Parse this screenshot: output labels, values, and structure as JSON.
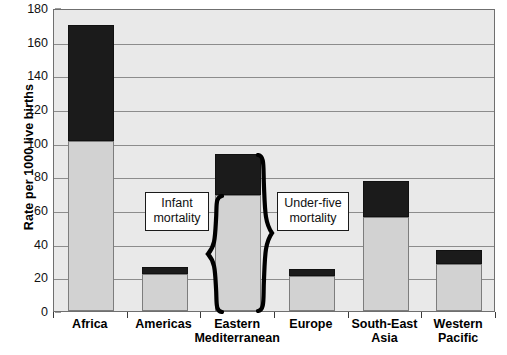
{
  "chart_data": {
    "type": "bar",
    "subtype": "stacked-bar",
    "title": "",
    "xlabel": "",
    "ylabel": "Rate per 1000 live births",
    "ylim": [
      0,
      180
    ],
    "yticks": [
      0,
      20,
      40,
      60,
      80,
      100,
      120,
      140,
      160,
      180
    ],
    "ytick_labels": [
      "0",
      "20",
      "40",
      "60",
      "80",
      "100",
      "120",
      "140",
      "160",
      "180"
    ],
    "grid": true,
    "legend_position": "none",
    "categories": [
      "Africa",
      "Americas",
      "Eastern\nMediterranean",
      "Europe",
      "South-East\nAsia",
      "Western\nPacific"
    ],
    "series": [
      {
        "name": "Infant mortality",
        "color": "#d2d2d2",
        "values": [
          101,
          22,
          69,
          21,
          56,
          28
        ]
      },
      {
        "name": "Under-five mortality (additional above infant)",
        "color": "#1b1b1b",
        "values": [
          69,
          4,
          24,
          4,
          21,
          8
        ]
      }
    ],
    "totals": {
      "label": "Under-five mortality (total bar height)",
      "values": [
        170,
        26,
        93,
        25,
        77,
        36
      ]
    },
    "annotations": [
      {
        "name": "infant-mortality-callout",
        "text": "Infant\nmortality"
      },
      {
        "name": "under-five-mortality-callout",
        "text": "Under-five\nmortality"
      }
    ],
    "colors": {
      "plot_background": "#e9e9e9",
      "gridline": "#8c8c8c",
      "axis": "#6f6f6f",
      "infant_bar": "#d2d2d2",
      "under_five_bar": "#1b1b1b",
      "text": "#000000"
    }
  }
}
